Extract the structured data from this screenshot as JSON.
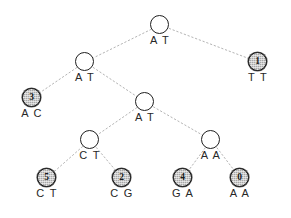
{
  "figure": {
    "name": "haplotype-tree-diagram",
    "width": 291,
    "height": 218,
    "background_color": "#ffffff",
    "edge_color": "#b4b4b4",
    "edge_style": "dashed",
    "internal_node_fill": "#ffffff",
    "leaf_node_fill": "#a8a8a8",
    "node_border_color": "#1f1f1f"
  },
  "nodes": [
    {
      "id": "n-root",
      "index": "",
      "label": "A T",
      "type": "internal",
      "x": 160,
      "y": 25
    },
    {
      "id": "n-at-l2",
      "index": "",
      "label": "A T",
      "type": "internal",
      "x": 85,
      "y": 62
    },
    {
      "id": "n-leaf-1",
      "index": "1",
      "label": "T T",
      "type": "leaf",
      "x": 258,
      "y": 62
    },
    {
      "id": "n-leaf-3",
      "index": "3",
      "label": "A C",
      "type": "leaf",
      "x": 32,
      "y": 98
    },
    {
      "id": "n-at-l3",
      "index": "",
      "label": "A T",
      "type": "internal",
      "x": 145,
      "y": 102
    },
    {
      "id": "n-ct",
      "index": "",
      "label": "C T",
      "type": "internal",
      "x": 90,
      "y": 140
    },
    {
      "id": "n-aa",
      "index": "",
      "label": "A A",
      "type": "internal",
      "x": 211,
      "y": 140
    },
    {
      "id": "n-leaf-5",
      "index": "5",
      "label": "C T",
      "type": "leaf",
      "x": 47,
      "y": 178
    },
    {
      "id": "n-leaf-2",
      "index": "2",
      "label": "C G",
      "type": "leaf",
      "x": 122,
      "y": 178
    },
    {
      "id": "n-leaf-4",
      "index": "4",
      "label": "G A",
      "type": "leaf",
      "x": 183,
      "y": 178
    },
    {
      "id": "n-leaf-0",
      "index": "0",
      "label": "A A",
      "type": "leaf",
      "x": 240,
      "y": 178
    }
  ],
  "edges": [
    {
      "from": "n-root",
      "to": "n-at-l2"
    },
    {
      "from": "n-root",
      "to": "n-leaf-1"
    },
    {
      "from": "n-at-l2",
      "to": "n-leaf-3"
    },
    {
      "from": "n-at-l2",
      "to": "n-at-l3"
    },
    {
      "from": "n-at-l3",
      "to": "n-ct"
    },
    {
      "from": "n-at-l3",
      "to": "n-aa"
    },
    {
      "from": "n-ct",
      "to": "n-leaf-5"
    },
    {
      "from": "n-ct",
      "to": "n-leaf-2"
    },
    {
      "from": "n-aa",
      "to": "n-leaf-4"
    },
    {
      "from": "n-aa",
      "to": "n-leaf-0"
    }
  ]
}
